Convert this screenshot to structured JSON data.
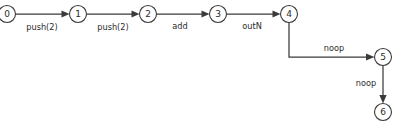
{
  "diagram": {
    "type": "state-machine-trace",
    "canvas": {
      "width": 400,
      "height": 125,
      "background": "#ffffff"
    },
    "style": {
      "node_stroke": "#3a3a3a",
      "node_fill": "#ffffff",
      "edge_stroke": "#3a3a3a",
      "text_color": "#2b2b2b",
      "node_radius": 8.5
    },
    "nodes": [
      {
        "id": "n0",
        "label": "0",
        "cx": 7,
        "cy": 14,
        "clipped_left": true
      },
      {
        "id": "n1",
        "label": "1",
        "cx": 78,
        "cy": 14,
        "clipped_left": false
      },
      {
        "id": "n2",
        "label": "2",
        "cx": 148,
        "cy": 14,
        "clipped_left": false
      },
      {
        "id": "n3",
        "label": "3",
        "cx": 218,
        "cy": 14,
        "clipped_left": false
      },
      {
        "id": "n4",
        "label": "4",
        "cx": 289,
        "cy": 14,
        "clipped_left": false
      },
      {
        "id": "n5",
        "label": "5",
        "cx": 383,
        "cy": 57,
        "clipped_left": false
      },
      {
        "id": "n6",
        "label": "6",
        "cx": 383,
        "cy": 112,
        "clipped_left": false
      }
    ],
    "edges": [
      {
        "id": "e0",
        "from": "n0",
        "to": "n1",
        "label": "push(2)",
        "label_x": 42,
        "label_y": 27,
        "shape": "straight-horizontal"
      },
      {
        "id": "e1",
        "from": "n1",
        "to": "n2",
        "label": "push(2)",
        "label_x": 113,
        "label_y": 27,
        "shape": "straight-horizontal"
      },
      {
        "id": "e2",
        "from": "n2",
        "to": "n3",
        "label": "add",
        "label_x": 180,
        "label_y": 26,
        "shape": "straight-horizontal"
      },
      {
        "id": "e3",
        "from": "n3",
        "to": "n4",
        "label": "outN",
        "label_x": 252,
        "label_y": 26,
        "shape": "straight-horizontal"
      },
      {
        "id": "e4",
        "from": "n4",
        "to": "n5",
        "label": "noop",
        "label_x": 334,
        "label_y": 48,
        "shape": "elbow-down-right"
      },
      {
        "id": "e5",
        "from": "n5",
        "to": "n6",
        "label": "noop",
        "label_x": 366,
        "label_y": 83,
        "shape": "straight-vertical"
      }
    ]
  }
}
